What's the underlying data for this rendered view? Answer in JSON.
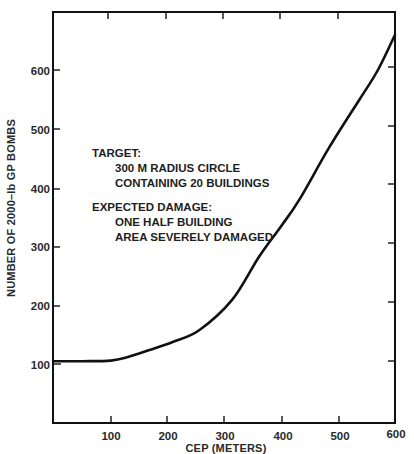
{
  "chart_data": {
    "type": "line",
    "title": "",
    "xlabel": "CEP (METERS)",
    "ylabel": "NUMBER OF 2000–lb GP BOMBS",
    "xlim": [
      0,
      600
    ],
    "ylim": [
      0,
      690
    ],
    "xticks": [
      100,
      200,
      300,
      400,
      500,
      600
    ],
    "yticks": [
      100,
      200,
      300,
      400,
      500,
      600
    ],
    "grid": false,
    "legend": null,
    "series": [
      {
        "name": "Bombs required vs CEP",
        "x": [
          0,
          50,
          100,
          130,
          168,
          210,
          256,
          314,
          361,
          400,
          432,
          484,
          537,
          570,
          600
        ],
        "y": [
          105,
          105,
          106,
          112,
          124,
          138,
          158,
          210,
          283,
          335,
          380,
          468,
          549,
          600,
          660
        ]
      }
    ],
    "annotations": [
      {
        "id": "target_heading",
        "text": "TARGET:"
      },
      {
        "id": "target_line1",
        "text": "300 M RADIUS CIRCLE"
      },
      {
        "id": "target_line2",
        "text": "CONTAINING 20 BUILDINGS"
      },
      {
        "id": "damage_heading",
        "text": "EXPECTED DAMAGE:"
      },
      {
        "id": "damage_line1",
        "text": "ONE HALF BUILDING"
      },
      {
        "id": "damage_line2",
        "text": "AREA SEVERELY DAMAGED"
      }
    ]
  },
  "labels": {
    "xlabel": "CEP (METERS)",
    "ylabel": "NUMBER OF 2000–lb GP BOMBS",
    "xticks": [
      "100",
      "200",
      "300",
      "400",
      "500",
      "600"
    ],
    "yticks": [
      "100",
      "200",
      "300",
      "400",
      "500",
      "600"
    ],
    "annotation": {
      "target_heading": "TARGET:",
      "target_line1": "300 M RADIUS CIRCLE",
      "target_line2": "CONTAINING 20 BUILDINGS",
      "damage_heading": "EXPECTED DAMAGE:",
      "damage_line1": "ONE HALF BUILDING",
      "damage_line2": "AREA SEVERELY DAMAGED"
    }
  },
  "colors": {
    "line": "#111111",
    "axis": "#111111",
    "text": "#2a2a2a",
    "background": "#ffffff"
  }
}
